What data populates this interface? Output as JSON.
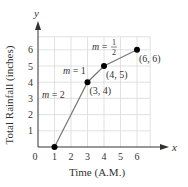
{
  "chart_data": {
    "type": "line",
    "title": "",
    "xlabel": "Time (A.M.)",
    "ylabel": "Total Rainfall (inches)",
    "x_axis_var": "x",
    "y_axis_var": "y",
    "xlim": [
      0,
      7.8
    ],
    "ylim": [
      0,
      7.6
    ],
    "x_ticks": [
      0,
      1,
      2,
      3,
      4,
      5,
      6
    ],
    "y_ticks": [
      1,
      2,
      3,
      4,
      5,
      6
    ],
    "grid": true,
    "legend": null,
    "series": [
      {
        "name": "Total Rainfall",
        "points": [
          {
            "x": 1,
            "y": 0,
            "label": ""
          },
          {
            "x": 3,
            "y": 4,
            "label": "(3, 4)"
          },
          {
            "x": 4,
            "y": 5,
            "label": "(4, 5)"
          },
          {
            "x": 6,
            "y": 6,
            "label": "(6, 6)"
          }
        ]
      }
    ],
    "annotations": [
      {
        "text": "m = 2",
        "segment": [
          [
            1,
            0
          ],
          [
            3,
            4
          ]
        ]
      },
      {
        "text": "m = 1",
        "segment": [
          [
            3,
            4
          ],
          [
            4,
            5
          ]
        ]
      },
      {
        "text": "m = 1/2",
        "segment": [
          [
            4,
            5
          ],
          [
            6,
            6
          ]
        ]
      }
    ]
  },
  "colors": {
    "axis": "#333333",
    "grid": "#d9d9d9",
    "line": "#777777",
    "point": "#000000",
    "text": "#333333"
  }
}
